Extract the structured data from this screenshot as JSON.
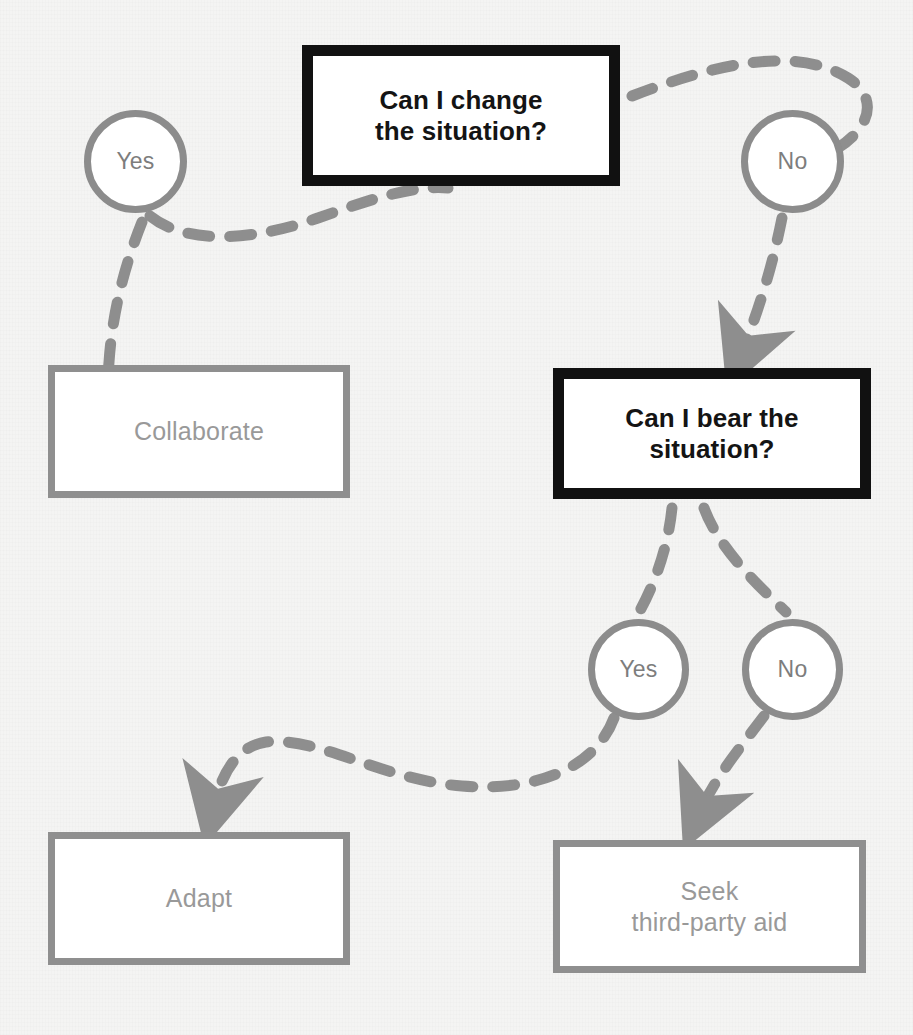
{
  "colors": {
    "background": "#f4f4f3",
    "decision_border": "#111111",
    "decision_text": "#141414",
    "outcome_border": "#8f8f8f",
    "outcome_text": "#999999",
    "branch_border": "#8c8c8c",
    "branch_text": "#7d7d7d",
    "connector": "#8e8e8e",
    "node_fill": "#ffffff"
  },
  "nodes": {
    "can_change": {
      "kind": "decision",
      "line1": "Can I change",
      "line2": "the situation?"
    },
    "yes_top": {
      "kind": "branch",
      "label": "Yes"
    },
    "no_top": {
      "kind": "branch",
      "label": "No"
    },
    "collaborate": {
      "kind": "outcome",
      "line1": "Collaborate",
      "line2": ""
    },
    "can_bear": {
      "kind": "decision",
      "line1": "Can I bear the",
      "line2": "situation?"
    },
    "yes_bottom": {
      "kind": "branch",
      "label": "Yes"
    },
    "no_bottom": {
      "kind": "branch",
      "label": "No"
    },
    "adapt": {
      "kind": "outcome",
      "line1": "Adapt",
      "line2": ""
    },
    "seek_aid": {
      "kind": "outcome",
      "line1": "Seek",
      "line2": "third-party aid"
    }
  },
  "edges": [
    {
      "id": "e1",
      "from": "can_change",
      "to": "no_top",
      "style": "dashed",
      "arrow": false
    },
    {
      "id": "e2",
      "from": "yes_top",
      "to": "can_change",
      "style": "dashed",
      "arrow": false
    },
    {
      "id": "e3",
      "from": "yes_top",
      "to": "collaborate",
      "style": "dashed",
      "arrow": true
    },
    {
      "id": "e4",
      "from": "no_top",
      "to": "can_bear",
      "style": "dashed",
      "arrow": true
    },
    {
      "id": "e5",
      "from": "can_bear",
      "to": "yes_bottom",
      "style": "dashed",
      "arrow": false
    },
    {
      "id": "e6",
      "from": "can_bear",
      "to": "no_bottom",
      "style": "dashed",
      "arrow": false
    },
    {
      "id": "e7",
      "from": "yes_bottom",
      "to": "adapt",
      "style": "dashed",
      "arrow": true
    },
    {
      "id": "e8",
      "from": "no_bottom",
      "to": "seek_aid",
      "style": "dashed",
      "arrow": true
    }
  ]
}
